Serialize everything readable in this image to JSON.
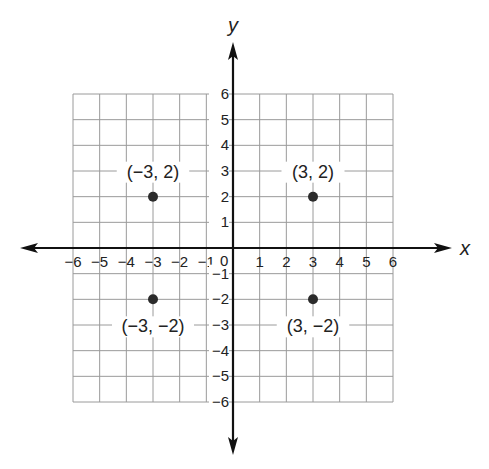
{
  "chart_data": {
    "type": "scatter",
    "title": "",
    "xlabel": "x",
    "ylabel": "y",
    "xlim": [
      -6,
      6
    ],
    "ylim": [
      -6,
      6
    ],
    "grid": true,
    "x_ticks": [
      "−6",
      "−5",
      "−4",
      "−3",
      "−2",
      "−1",
      "1",
      "2",
      "3",
      "4",
      "5",
      "6"
    ],
    "x_tick_values": [
      -6,
      -5,
      -4,
      -3,
      -2,
      -1,
      1,
      2,
      3,
      4,
      5,
      6
    ],
    "y_ticks": [
      "6",
      "5",
      "4",
      "3",
      "2",
      "1",
      "−1",
      "−2",
      "−3",
      "−4",
      "−5",
      "−6"
    ],
    "y_tick_values": [
      6,
      5,
      4,
      3,
      2,
      1,
      -1,
      -2,
      -3,
      -4,
      -5,
      -6
    ],
    "origin_label": "0",
    "points": [
      {
        "x": -3,
        "y": 2,
        "label": "(−3, 2)",
        "label_position": "above"
      },
      {
        "x": 3,
        "y": 2,
        "label": "(3, 2)",
        "label_position": "above"
      },
      {
        "x": -3,
        "y": -2,
        "label": "(−3, −2)",
        "label_position": "below"
      },
      {
        "x": 3,
        "y": -2,
        "label": "(3, −2)",
        "label_position": "below"
      }
    ]
  }
}
